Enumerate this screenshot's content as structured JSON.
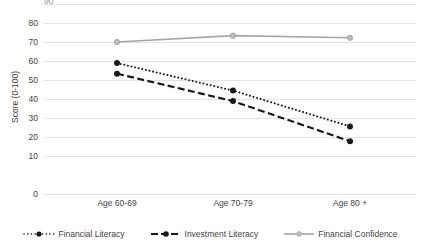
{
  "chart_data": {
    "type": "line",
    "title": "",
    "subtitle": "",
    "xlabel": "",
    "ylabel": "Score (0-100)",
    "categories": [
      "Age 60-69",
      "Age 70-79",
      "Age 80 +"
    ],
    "ylim": [
      0,
      90
    ],
    "ytick_labels": [
      "0",
      "10",
      "20",
      "30",
      "40",
      "50",
      "60",
      "70",
      "80"
    ],
    "ytick_values": [
      0,
      10,
      20,
      30,
      40,
      50,
      60,
      70,
      80
    ],
    "grid": "horizontal",
    "legend_position": "bottom",
    "series": [
      {
        "name": "Financial Literacy",
        "values": [
          62,
          49,
          32
        ],
        "line_style": "dotted",
        "color": "#1a1a1a",
        "marker": "circle"
      },
      {
        "name": "Investment Literacy",
        "values": [
          57,
          44,
          25
        ],
        "line_style": "dashed",
        "color": "#1a1a1a",
        "marker": "circle"
      },
      {
        "name": "Financial Confidence",
        "values": [
          72,
          75,
          74
        ],
        "line_style": "solid",
        "color": "#a6a6a6",
        "marker": "circle"
      }
    ]
  },
  "axis": {
    "y_title": "Score (0-100)",
    "y_ticks": [
      "80",
      "70",
      "60",
      "50",
      "40",
      "30",
      "20",
      "10",
      "0"
    ],
    "x_ticks": [
      "Age 60-69",
      "Age 70-79",
      "Age 80 +"
    ],
    "top_clipped_label": "90"
  },
  "legend": {
    "items": [
      {
        "label": "Financial Literacy",
        "style": "dotted",
        "color": "#1a1a1a"
      },
      {
        "label": "Investment Literacy",
        "style": "dashed",
        "color": "#1a1a1a"
      },
      {
        "label": "Financial Confidence",
        "style": "solid",
        "color": "#a6a6a6"
      }
    ]
  },
  "colors": {
    "grid": "#e3e3e3",
    "text": "#3f3f3f",
    "dark_series": "#1a1a1a",
    "gray_series": "#a6a6a6",
    "background": "#ffffff"
  }
}
